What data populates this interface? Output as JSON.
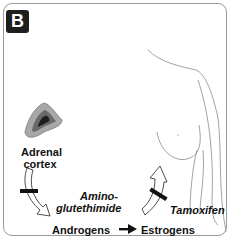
{
  "panel": {
    "badge": "B"
  },
  "labels": {
    "adrenal_line1": "Adrenal",
    "adrenal_line2": "cortex",
    "inhibitor1_line1": "Amino-",
    "inhibitor1_line2": "glutethimide",
    "inhibitor2": "Tamoxifen",
    "androgens": "Androgens",
    "estrogens": "Estrogens"
  },
  "colors": {
    "ink": "#111111",
    "border": "#9a9a9a",
    "badge_bg": "#1e1e1e",
    "body_outline": "#8a8a8a",
    "adrenal_outer": "#9c9c9c",
    "adrenal_inner": "#2a2a2a"
  }
}
